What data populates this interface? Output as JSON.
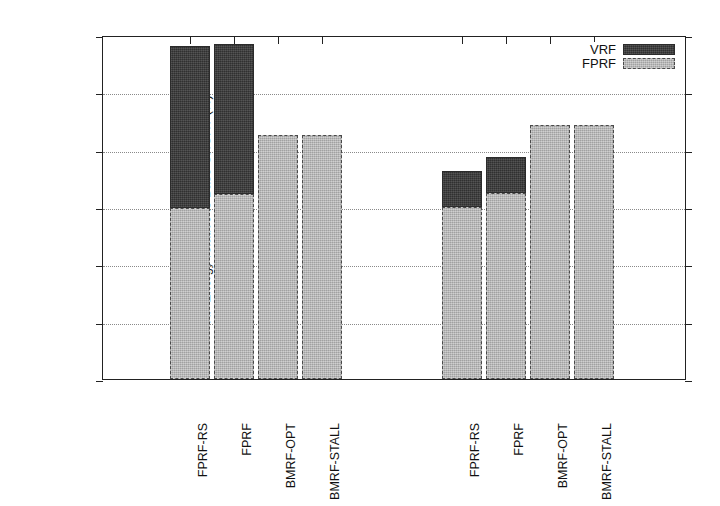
{
  "chart_data": {
    "type": "bar",
    "title": "",
    "subtitle": "",
    "xlabel": "",
    "ylabel": "RF Energy relative to Base-SHORT (%)",
    "ylim": [
      0,
      12
    ],
    "ytick_labels": [
      "0",
      "2",
      "4",
      "6",
      "8",
      "10",
      "12"
    ],
    "ytick_values": [
      0,
      2,
      4,
      6,
      8,
      10,
      12
    ],
    "grid": "horizontal-dotted",
    "stacked": true,
    "legend_position": "top-right",
    "legend": [
      {
        "name": "VRF",
        "color": "#3b3b3b"
      },
      {
        "name": "FPRF",
        "color": "#b3b3b3"
      }
    ],
    "groups": [
      {
        "name": "group-1",
        "categories": [
          "FPRF-RS",
          "FPRF",
          "BMRF-OPT",
          "BMRF-STALL"
        ]
      },
      {
        "name": "group-2",
        "categories": [
          "FPRF-RS",
          "FPRF",
          "BMRF-OPT",
          "BMRF-STALL"
        ]
      }
    ],
    "categories": [
      "FPRF-RS",
      "FPRF",
      "BMRF-OPT",
      "BMRF-STALL",
      "FPRF-RS",
      "FPRF",
      "BMRF-OPT",
      "BMRF-STALL"
    ],
    "series": [
      {
        "name": "FPRF",
        "values": [
          5.95,
          6.45,
          8.5,
          8.5,
          6.0,
          6.5,
          8.85,
          8.85
        ]
      },
      {
        "name": "VRF",
        "values": [
          5.65,
          5.25,
          0.0,
          0.0,
          1.25,
          1.25,
          0.0,
          0.0
        ]
      }
    ],
    "totals": [
      11.6,
      11.7,
      8.5,
      8.5,
      7.25,
      7.75,
      8.85,
      8.85
    ],
    "bars": [
      {
        "group": 0,
        "index": 0,
        "label": "FPRF-RS",
        "fprf": 5.95,
        "vrf": 5.65,
        "total": 11.6,
        "x0": 169,
        "x1": 209
      },
      {
        "group": 0,
        "index": 1,
        "label": "FPRF",
        "fprf": 6.45,
        "vrf": 5.25,
        "total": 11.7,
        "x0": 213,
        "x1": 253
      },
      {
        "group": 0,
        "index": 2,
        "label": "BMRF-OPT",
        "fprf": 8.5,
        "vrf": 0.0,
        "total": 8.5,
        "x0": 257,
        "x1": 297
      },
      {
        "group": 0,
        "index": 3,
        "label": "BMRF-STALL",
        "fprf": 8.5,
        "vrf": 0.0,
        "total": 8.5,
        "x0": 301,
        "x1": 341
      },
      {
        "group": 1,
        "index": 0,
        "label": "FPRF-RS",
        "fprf": 6.0,
        "vrf": 1.25,
        "total": 7.25,
        "x0": 441,
        "x1": 481
      },
      {
        "group": 1,
        "index": 1,
        "label": "FPRF",
        "fprf": 6.5,
        "vrf": 1.25,
        "total": 7.75,
        "x0": 485,
        "x1": 525
      },
      {
        "group": 1,
        "index": 2,
        "label": "BMRF-OPT",
        "fprf": 8.85,
        "vrf": 0.0,
        "total": 8.85,
        "x0": 529,
        "x1": 569
      },
      {
        "group": 1,
        "index": 3,
        "label": "BMRF-STALL",
        "fprf": 8.85,
        "vrf": 0.0,
        "total": 8.85,
        "x0": 573,
        "x1": 613
      }
    ],
    "axis_tick_x_positions": [
      189,
      233,
      277,
      321,
      461,
      505,
      549,
      593
    ],
    "colors": {
      "vrf": "#3b3b3b",
      "fprf": "#b3b3b3",
      "axis": "#222222",
      "grid": "#8a8a8a",
      "background": "#ffffff"
    }
  }
}
